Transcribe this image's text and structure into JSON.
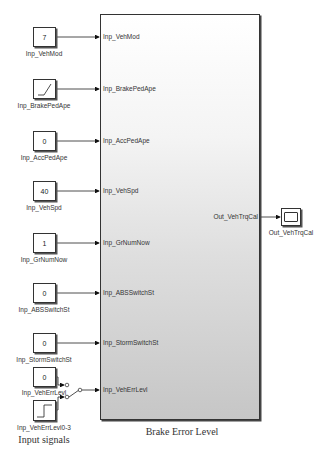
{
  "diagram": {
    "type": "simulink-block-diagram",
    "subsystem": {
      "name": "Brake Error Level",
      "inputs": [
        "Inp_VehMod",
        "Inp_BrakePedApe",
        "Inp_AccPedApe",
        "Inp_VehSpd",
        "Inp_GrNumNow",
        "Inp_ABSSwitchSt",
        "Inp_StormSwitchSt",
        "Inp_VehErrLevl"
      ],
      "outputs": [
        "Out_VehTrqCal"
      ]
    },
    "source_blocks": [
      {
        "name": "Inp_VehMod",
        "kind": "constant",
        "value": "7"
      },
      {
        "name": "Inp_BrakePedApe",
        "kind": "ramp",
        "value": ""
      },
      {
        "name": "Inp_AccPedApe",
        "kind": "constant",
        "value": "0"
      },
      {
        "name": "Inp_VehSpd",
        "kind": "constant",
        "value": "40"
      },
      {
        "name": "Inp_GrNumNow",
        "kind": "constant",
        "value": "1"
      },
      {
        "name": "Inp_ABSSwitchSt",
        "kind": "constant",
        "value": "0"
      },
      {
        "name": "Inp_StormSwitchSt",
        "kind": "constant",
        "value": "0"
      },
      {
        "name": "Inp_VehErrLevl",
        "kind": "constant",
        "value": "0"
      },
      {
        "name": "Inp_VehErrLevl0-3",
        "kind": "step",
        "value": ""
      }
    ],
    "sink_blocks": [
      {
        "name": "Out_VehTrqCal",
        "kind": "scope"
      }
    ],
    "switch": {
      "name": "manual-switch",
      "kind": "manual-switch"
    },
    "group_caption": "Input signals"
  }
}
